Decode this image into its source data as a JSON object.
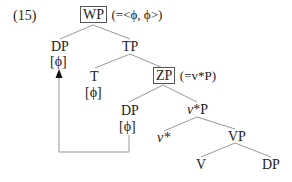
{
  "example_number": "(15)",
  "tree": {
    "root": {
      "label": "WP",
      "boxed": true,
      "annotation": "(=<ϕ, ϕ>)"
    },
    "dp_spec": {
      "label": "DP",
      "feature": "[ϕ]"
    },
    "tp": {
      "label": "TP"
    },
    "t": {
      "label": "T",
      "feature": "[ϕ]"
    },
    "zp": {
      "label": "ZP",
      "boxed": true,
      "annotation": "(=v*P)"
    },
    "dp_mid": {
      "label": "DP",
      "feature": "[ϕ]"
    },
    "vstar_p": {
      "label_italic": "v",
      "label_rest": "*P"
    },
    "vstar": {
      "label_italic": "v",
      "label_rest": "*"
    },
    "vp": {
      "label": "VP"
    },
    "v": {
      "label": "V"
    },
    "dp_obj": {
      "label": "DP"
    }
  },
  "movement_arrow": {
    "from": "dp_mid",
    "to": "dp_spec"
  },
  "colors": {
    "line": "#999999",
    "text": "#222222",
    "arrow": "#111111"
  }
}
